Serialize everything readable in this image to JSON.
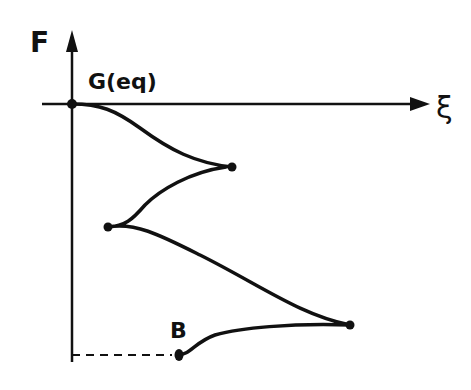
{
  "diagram": {
    "y_axis_label": "F",
    "x_axis_label": "ξ",
    "start_label": "G(eq)",
    "end_label": "B",
    "colors": {
      "ink": "#111111",
      "background": "#ffffff"
    },
    "points": [
      {
        "name": "G(eq)",
        "x": 72,
        "y": 104
      },
      {
        "name": "cusp-1",
        "x": 232,
        "y": 167
      },
      {
        "name": "cusp-2",
        "x": 108,
        "y": 227
      },
      {
        "name": "cusp-3",
        "x": 350,
        "y": 325
      },
      {
        "name": "B",
        "x": 178,
        "y": 355
      }
    ]
  }
}
